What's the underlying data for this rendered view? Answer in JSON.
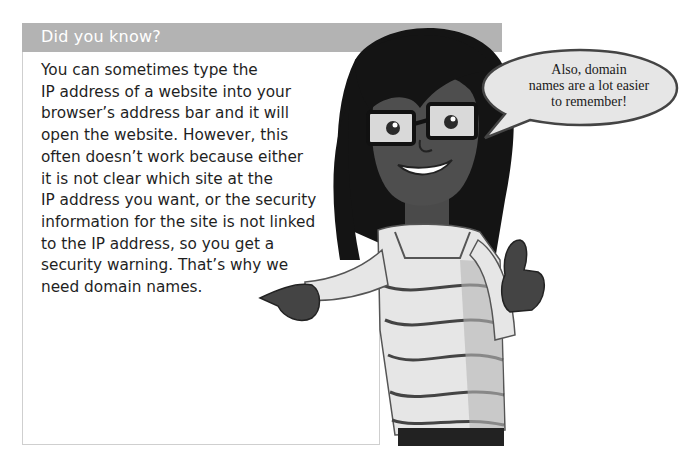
{
  "box": {
    "title": "Did you know?",
    "lines": [
      "You can sometimes type the",
      "IP address of a website into your",
      "browser’s address bar and it will",
      "open the website. However, this",
      "often doesn’t work because either",
      "it is not clear which site at the",
      "IP address you want, or the security",
      "information for the site is not linked",
      "to the IP address, so you get a",
      "security warning. That’s why we",
      "need domain names."
    ]
  },
  "speech_bubble": {
    "lines": [
      "Also, domain",
      "names are a lot easier",
      "to remember!"
    ]
  },
  "illustration": {
    "subject": "cartoon girl with glasses, striped shirt, pointing",
    "header_color": "#b3b3b3",
    "border_color": "#cfcfcf"
  }
}
